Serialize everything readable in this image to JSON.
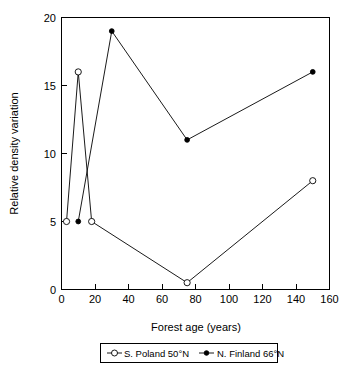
{
  "chart_data": {
    "type": "line",
    "title": "",
    "xlabel": "Forest age (years)",
    "ylabel": "Relative density variation",
    "xlim": [
      0,
      160
    ],
    "ylim": [
      0,
      20
    ],
    "xticks": [
      0,
      20,
      40,
      60,
      80,
      100,
      120,
      140,
      160
    ],
    "yticks": [
      0,
      5,
      10,
      15,
      20
    ],
    "grid": false,
    "legend_position": "bottom-center",
    "series": [
      {
        "name": "S. Poland 50°N",
        "marker": "open-circle",
        "x": [
          3,
          10,
          18,
          75,
          150
        ],
        "values": [
          5,
          16,
          5,
          0.5,
          8
        ]
      },
      {
        "name": "N. Finland 66°N",
        "marker": "filled-circle",
        "x": [
          10,
          30,
          75,
          150
        ],
        "values": [
          5,
          19,
          11,
          16
        ]
      }
    ]
  },
  "axes": {
    "x_title": "Forest age (years)",
    "y_title": "Relative density variation",
    "x_tick_labels": [
      "0",
      "20",
      "40",
      "60",
      "80",
      "100",
      "120",
      "140",
      "160"
    ],
    "y_tick_labels": [
      "0",
      "5",
      "10",
      "15",
      "20"
    ]
  },
  "legend": {
    "entries": [
      {
        "label": "S. Poland 50°N",
        "marker": "open-circle"
      },
      {
        "label": "N. Finland 66°N",
        "marker": "filled-circle"
      }
    ]
  },
  "colors": {
    "ink": "#000000",
    "background": "#ffffff"
  }
}
